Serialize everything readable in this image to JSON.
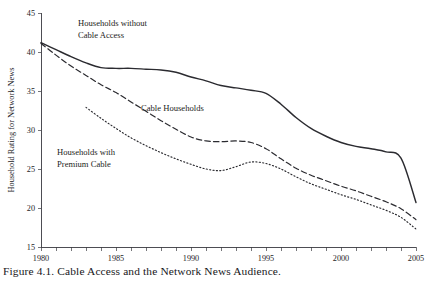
{
  "figure": {
    "caption": "Figure 4.1. Cable Access and the Network News Audience."
  },
  "chart_data": {
    "type": "line",
    "title": "",
    "xlabel": "",
    "ylabel": "Household Rating for Network News",
    "xlim": [
      1980,
      2005
    ],
    "ylim": [
      15,
      45
    ],
    "grid": false,
    "legend_position": "inline-annotations",
    "x_ticks_labeled": [
      "1980",
      "1985",
      "1990",
      "1995",
      "2000",
      "2005"
    ],
    "x_tick_values": [
      1980,
      1985,
      1990,
      1995,
      2000,
      2005
    ],
    "x_minor_tick_step": 1,
    "y_ticks": [
      15,
      20,
      25,
      30,
      35,
      40,
      45
    ],
    "y_tick_labels": [
      "15",
      "20",
      "25",
      "30",
      "35",
      "40",
      "45"
    ],
    "series": [
      {
        "name": "Households without Cable Access",
        "style": "solid",
        "color": "#2b2b30",
        "x": [
          1980,
          1981,
          1982,
          1983,
          1984,
          1985,
          1986,
          1987,
          1988,
          1989,
          1990,
          1991,
          1992,
          1993,
          1994,
          1995,
          1996,
          1997,
          1998,
          1999,
          2000,
          2001,
          2002,
          2003,
          2004,
          2005
        ],
        "values": [
          41.2,
          40.3,
          39.4,
          38.6,
          38.0,
          37.9,
          37.9,
          37.8,
          37.7,
          37.4,
          36.8,
          36.3,
          35.7,
          35.4,
          35.1,
          34.7,
          33.3,
          31.6,
          30.2,
          29.2,
          28.4,
          27.9,
          27.6,
          27.2,
          26.4,
          20.7
        ]
      },
      {
        "name": "Cable Households",
        "style": "dashed",
        "color": "#2b2b30",
        "x": [
          1980,
          1981,
          1982,
          1983,
          1984,
          1985,
          1986,
          1987,
          1988,
          1989,
          1990,
          1991,
          1992,
          1993,
          1994,
          1995,
          1996,
          1997,
          1998,
          1999,
          2000,
          2001,
          2002,
          2003,
          2004,
          2005
        ],
        "values": [
          41.1,
          39.6,
          38.2,
          37.0,
          35.8,
          34.8,
          33.6,
          32.4,
          31.2,
          30.1,
          29.1,
          28.6,
          28.5,
          28.6,
          28.4,
          27.6,
          26.3,
          25.1,
          24.2,
          23.5,
          22.8,
          22.2,
          21.5,
          20.8,
          19.9,
          18.5
        ]
      },
      {
        "name": "Households with Premium Cable",
        "style": "dotted",
        "color": "#2b2b30",
        "x": [
          1983,
          1984,
          1985,
          1986,
          1987,
          1988,
          1989,
          1990,
          1991,
          1992,
          1993,
          1994,
          1995,
          1996,
          1997,
          1998,
          1999,
          2000,
          2001,
          2002,
          2003,
          2004,
          2005
        ],
        "values": [
          32.9,
          31.5,
          30.2,
          29.0,
          28.0,
          27.1,
          26.3,
          25.6,
          25.0,
          24.8,
          25.3,
          25.9,
          25.7,
          25.0,
          24.0,
          23.1,
          22.4,
          21.7,
          21.1,
          20.4,
          19.7,
          18.8,
          17.3
        ]
      }
    ],
    "annotations": [
      {
        "id": "annotation-no-cable",
        "lines": [
          "Households without",
          "Cable Access"
        ],
        "x_px": 78,
        "y_px": 26
      },
      {
        "id": "annotation-cable-households",
        "lines": [
          "Cable Households"
        ],
        "x_px": 141,
        "y_px": 111
      },
      {
        "id": "annotation-premium-cable",
        "lines": [
          "Households with",
          "Premium Cable"
        ],
        "x_px": 57,
        "y_px": 155
      }
    ]
  }
}
